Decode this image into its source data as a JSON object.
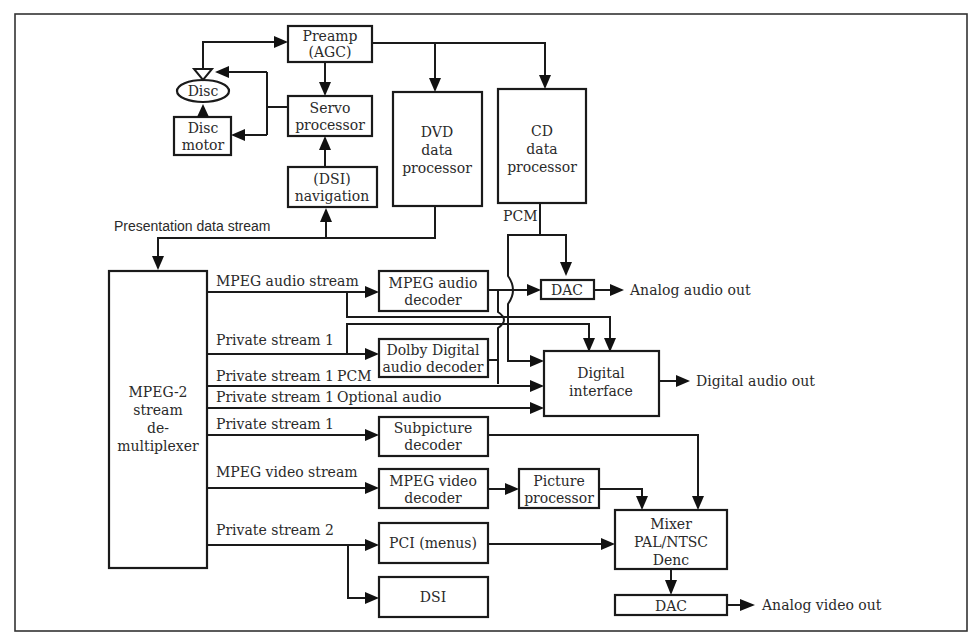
{
  "diagram": {
    "blocks": {
      "preamp": [
        "Preamp",
        "(AGC)"
      ],
      "disc": "Disc",
      "disc_motor": [
        "Disc",
        "motor"
      ],
      "servo": [
        "Servo",
        "processor"
      ],
      "dsi_nav": [
        "(DSI)",
        "navigation"
      ],
      "dvd_data": [
        "DVD",
        "data",
        "processor"
      ],
      "cd_data": [
        "CD",
        "data",
        "processor"
      ],
      "demux": [
        "MPEG-2",
        "stream",
        "de-",
        "multiplexer"
      ],
      "mpeg_audio": [
        "MPEG audio",
        "decoder"
      ],
      "dac_audio": "DAC",
      "dolby": [
        "Dolby Digital",
        "audio decoder"
      ],
      "digital_interface": [
        "Digital",
        "interface"
      ],
      "subpicture": [
        "Subpicture",
        "decoder"
      ],
      "mpeg_video": [
        "MPEG video",
        "decoder"
      ],
      "picture": [
        "Picture",
        "processor"
      ],
      "pci": "PCI (menus)",
      "dsi": "DSI",
      "mixer": [
        "Mixer",
        "PAL/NTSC",
        "Denc"
      ],
      "dac_video": "DAC"
    },
    "labels": {
      "presentation": "Presentation data stream",
      "pcm_cd": "PCM",
      "mpeg_audio_stream": "MPEG audio stream",
      "private1_a": "Private stream 1",
      "private1_b": "Private stream 1",
      "pcm": "PCM",
      "private1_c": "Private stream 1",
      "optional_audio": "Optional audio",
      "private1_d": "Private stream 1",
      "mpeg_video_stream": "MPEG video stream",
      "private2": "Private stream 2",
      "analog_audio_out": "Analog audio out",
      "digital_audio_out": "Digital audio out",
      "analog_video_out": "Analog video out"
    }
  }
}
